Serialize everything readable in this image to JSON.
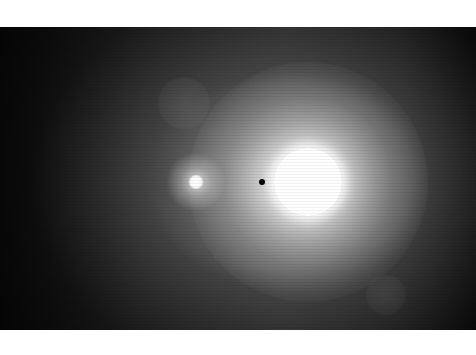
{
  "image": {
    "description": "Grayscale astronomical exposure: a saturated bright star with a surrounding glow, a fainter companion glow to its left, a small dark occulting dot between them, and faint ghost reflections",
    "colors": {
      "background": "#ffffff",
      "frame_dark": "#0c0c0c",
      "glow": "#c8c8c8",
      "star_core": "#ffffff",
      "dot": "#050505"
    },
    "objects": [
      {
        "name": "bright-star",
        "center": [
          308,
          182
        ],
        "radius": 34
      },
      {
        "name": "companion-source",
        "center": [
          196,
          182
        ],
        "radius": 7
      },
      {
        "name": "dark-dot",
        "center": [
          262,
          182
        ],
        "radius": 3
      },
      {
        "name": "ghost-reflection",
        "center": [
          184,
          103
        ],
        "radius": 26
      },
      {
        "name": "ghost-reflection",
        "center": [
          386,
          295
        ],
        "radius": 20
      }
    ]
  }
}
